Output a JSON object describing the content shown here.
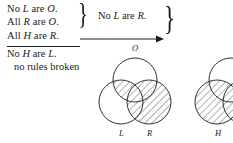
{
  "figure": {
    "background_color": "#ffffff",
    "ink_color": "#1a1a1a",
    "hatch_color": "#3a3a3a"
  },
  "proof": {
    "premises": [
      {
        "id": "p1",
        "quantifier": "No",
        "subject": "L",
        "copula": "are",
        "predicate": "O.",
        "text": "No L are O."
      },
      {
        "id": "p2",
        "quantifier": "All",
        "subject": "R",
        "copula": "are",
        "predicate": "O.",
        "text": "All R are O."
      },
      {
        "id": "p3",
        "quantifier": "All",
        "subject": "H",
        "copula": "are",
        "predicate": "R.",
        "text": "All H are R."
      }
    ],
    "conclusion": {
      "id": "c1",
      "quantifier": "No",
      "subject": "H",
      "copula": "are",
      "predicate": "L.",
      "text": "No H are L."
    },
    "note": "no rules broken",
    "derived": {
      "id": "d1",
      "quantifier": "No",
      "subject": "L",
      "copula": "are",
      "predicate": "R.",
      "text": "No L are R."
    },
    "brace_glyph": "}",
    "arrow_name": "rightwards-arrow"
  },
  "diagrams": [
    {
      "id": "venn-left",
      "type": "three-circle-venn",
      "labels": [
        {
          "name": "O",
          "position": "top"
        },
        {
          "name": "L",
          "position": "bottom-left"
        },
        {
          "name": "R",
          "position": "bottom-right"
        }
      ],
      "shaded_regions": [
        "L∩O",
        "L∩R",
        "R only"
      ]
    },
    {
      "id": "venn-right",
      "type": "three-circle-venn-cropped",
      "labels": [
        {
          "name": "H",
          "position": "bottom-left"
        }
      ],
      "shaded_regions": [
        "H"
      ]
    }
  ]
}
